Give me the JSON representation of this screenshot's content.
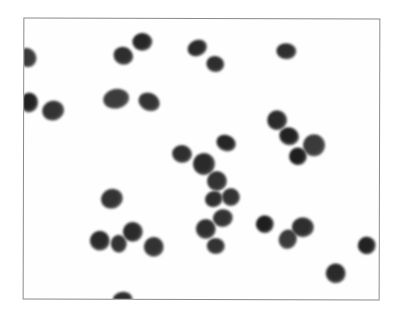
{
  "image": {
    "description": "Grayscale micrograph of round stained cells on a white background inside a thin gray frame",
    "frame": {
      "left": 23,
      "top": 18,
      "right": 380,
      "bottom": 300,
      "border_color": "#8a8a8a"
    },
    "cells": [
      {
        "x": 26,
        "y": 57,
        "rx": 9,
        "ry": 10,
        "tone": "#3a3a3a"
      },
      {
        "x": 28,
        "y": 102,
        "rx": 9,
        "ry": 10,
        "tone": "#222222"
      },
      {
        "x": 52,
        "y": 110,
        "rx": 11,
        "ry": 10,
        "tone": "#333333"
      },
      {
        "x": 122,
        "y": 55,
        "rx": 10,
        "ry": 9,
        "tone": "#2e2e2e"
      },
      {
        "x": 141,
        "y": 41,
        "rx": 10,
        "ry": 9,
        "tone": "#262626"
      },
      {
        "x": 196,
        "y": 47,
        "rx": 10,
        "ry": 8,
        "tone": "#2a2a2a"
      },
      {
        "x": 214,
        "y": 63,
        "rx": 9,
        "ry": 8,
        "tone": "#2e2e2e"
      },
      {
        "x": 115,
        "y": 98,
        "rx": 13,
        "ry": 10,
        "tone": "#3c3c3c"
      },
      {
        "x": 148,
        "y": 101,
        "rx": 11,
        "ry": 9,
        "tone": "#333333"
      },
      {
        "x": 285,
        "y": 50,
        "rx": 10,
        "ry": 8,
        "tone": "#2e2e2e"
      },
      {
        "x": 276,
        "y": 119,
        "rx": 10,
        "ry": 10,
        "tone": "#2a2a2a"
      },
      {
        "x": 288,
        "y": 135,
        "rx": 10,
        "ry": 9,
        "tone": "#222222"
      },
      {
        "x": 313,
        "y": 144,
        "rx": 11,
        "ry": 11,
        "tone": "#3a3a3a"
      },
      {
        "x": 297,
        "y": 155,
        "rx": 9,
        "ry": 9,
        "tone": "#1e1e1e"
      },
      {
        "x": 181,
        "y": 153,
        "rx": 10,
        "ry": 9,
        "tone": "#2e2e2e"
      },
      {
        "x": 203,
        "y": 163,
        "rx": 11,
        "ry": 11,
        "tone": "#2a2a2a"
      },
      {
        "x": 225,
        "y": 142,
        "rx": 10,
        "ry": 8,
        "tone": "#262626"
      },
      {
        "x": 216,
        "y": 180,
        "rx": 10,
        "ry": 10,
        "tone": "#333333"
      },
      {
        "x": 213,
        "y": 198,
        "rx": 9,
        "ry": 8,
        "tone": "#2e2e2e"
      },
      {
        "x": 230,
        "y": 196,
        "rx": 9,
        "ry": 9,
        "tone": "#333333"
      },
      {
        "x": 222,
        "y": 217,
        "rx": 10,
        "ry": 9,
        "tone": "#333333"
      },
      {
        "x": 205,
        "y": 228,
        "rx": 10,
        "ry": 10,
        "tone": "#2e2e2e"
      },
      {
        "x": 215,
        "y": 245,
        "rx": 9,
        "ry": 8,
        "tone": "#333333"
      },
      {
        "x": 111,
        "y": 198,
        "rx": 11,
        "ry": 10,
        "tone": "#333333"
      },
      {
        "x": 99,
        "y": 240,
        "rx": 10,
        "ry": 10,
        "tone": "#2a2a2a"
      },
      {
        "x": 118,
        "y": 243,
        "rx": 8,
        "ry": 9,
        "tone": "#333333"
      },
      {
        "x": 132,
        "y": 231,
        "rx": 10,
        "ry": 10,
        "tone": "#2a2a2a"
      },
      {
        "x": 153,
        "y": 246,
        "rx": 10,
        "ry": 10,
        "tone": "#333333"
      },
      {
        "x": 264,
        "y": 223,
        "rx": 9,
        "ry": 9,
        "tone": "#1e1e1e"
      },
      {
        "x": 287,
        "y": 238,
        "rx": 9,
        "ry": 10,
        "tone": "#3a3a3a"
      },
      {
        "x": 302,
        "y": 226,
        "rx": 11,
        "ry": 10,
        "tone": "#2e2e2e"
      },
      {
        "x": 366,
        "y": 244,
        "rx": 9,
        "ry": 9,
        "tone": "#222222"
      },
      {
        "x": 335,
        "y": 272,
        "rx": 10,
        "ry": 10,
        "tone": "#2a2a2a"
      },
      {
        "x": 122,
        "y": 299,
        "rx": 10,
        "ry": 8,
        "tone": "#2e2e2e"
      }
    ]
  }
}
